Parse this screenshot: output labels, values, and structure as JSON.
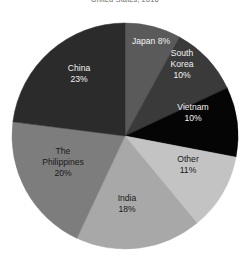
{
  "chart": {
    "title": "United States, 2016"
  },
  "chart_data": {
    "type": "pie",
    "title": "United States, 2016",
    "xlabel": "",
    "ylabel": "",
    "legend_position": "none",
    "grid": false,
    "labels_inside": true,
    "start_angle_deg": 0,
    "direction": "clockwise",
    "center": {
      "x": 125,
      "y": 136,
      "r": 113
    },
    "categories": [
      "Japan",
      "South Korea",
      "Vietnam",
      "Other",
      "India",
      "The Philippines",
      "China"
    ],
    "values": [
      8,
      10,
      10,
      11,
      18,
      20,
      23
    ],
    "unit": "%",
    "slices": [
      {
        "name": "Japan",
        "value": 8,
        "label_line1": "Japan 8%",
        "label_line2": "",
        "color": "#5a5a5a",
        "text_color": "#f2f2f2",
        "label_x": 151,
        "label_y": 42
      },
      {
        "name": "South Korea",
        "value": 10,
        "label_line1": "South",
        "label_line2": "Korea",
        "label_line3": "10%",
        "color": "#3a3a3a",
        "text_color": "#f2f2f2",
        "label_x": 182,
        "label_y": 65
      },
      {
        "name": "Vietnam",
        "value": 10,
        "label_line1": "Vietnam",
        "label_line2": "10%",
        "color": "#050505",
        "text_color": "#f2f2f2",
        "label_x": 193,
        "label_y": 113
      },
      {
        "name": "Other",
        "value": 11,
        "label_line1": "Other",
        "label_line2": "11%",
        "color": "#c3c3c3",
        "text_color": "#1a1a1a",
        "label_x": 188,
        "label_y": 165
      },
      {
        "name": "India",
        "value": 18,
        "label_line1": "India",
        "label_line2": "18%",
        "color": "#a8a8a8",
        "text_color": "#1a1a1a",
        "label_x": 127,
        "label_y": 204
      },
      {
        "name": "The Philippines",
        "value": 20,
        "label_line1": "The",
        "label_line2": "Philippines",
        "label_line3": "20%",
        "color": "#7d7d7d",
        "text_color": "#1a1a1a",
        "label_x": 63,
        "label_y": 163
      },
      {
        "name": "China",
        "value": 23,
        "label_line1": "China",
        "label_line2": "23%",
        "color": "#2b2b2b",
        "text_color": "#f2f2f2",
        "label_x": 79,
        "label_y": 74
      }
    ]
  }
}
